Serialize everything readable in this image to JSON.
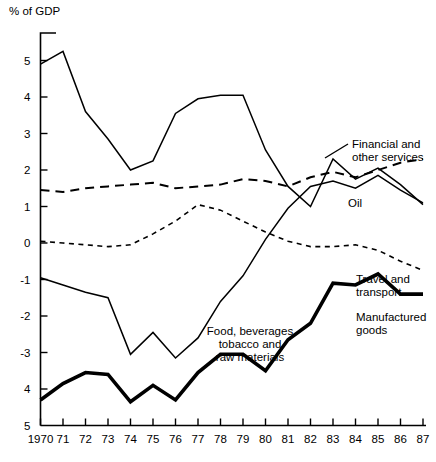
{
  "chart_data": {
    "type": "line",
    "title": "",
    "ylabel": "% of GDP",
    "xlabel": "",
    "ylim": [
      -5,
      5.6
    ],
    "xlim": [
      1970,
      1987
    ],
    "grid": false,
    "legend_position": "inline-annotations",
    "yticks": [
      5,
      4,
      3,
      2,
      1,
      0,
      -1,
      -2,
      -3,
      -4,
      -5
    ],
    "ytick_labels": [
      "5",
      "4",
      "3",
      "2",
      "1",
      "0",
      "-1",
      "-2",
      "-3",
      "4",
      "5"
    ],
    "x": [
      1970,
      1971,
      1972,
      1973,
      1974,
      1975,
      1976,
      1977,
      1978,
      1979,
      1980,
      1981,
      1982,
      1983,
      1984,
      1985,
      1986,
      1987
    ],
    "xtick_labels": [
      "1970",
      "71",
      "72",
      "73",
      "74",
      "75",
      "76",
      "77",
      "78",
      "79",
      "80",
      "81",
      "82",
      "83",
      "84",
      "85",
      "86",
      "87"
    ],
    "series": [
      {
        "name": "Oil",
        "style": "solid-thin",
        "values": [
          4.9,
          5.25,
          3.6,
          2.85,
          2.0,
          2.25,
          3.55,
          3.95,
          4.05,
          4.05,
          2.55,
          1.55,
          1.0,
          2.3,
          1.75,
          2.05,
          1.6,
          1.05
        ]
      },
      {
        "name": "Financial and other services",
        "style": "dashed-long",
        "values": [
          1.45,
          1.4,
          1.5,
          1.55,
          1.6,
          1.65,
          1.5,
          1.55,
          1.6,
          1.75,
          1.7,
          1.55,
          1.8,
          1.95,
          1.8,
          2.0,
          2.2,
          2.3
        ]
      },
      {
        "name": "Travel and transport",
        "style": "dashed-short",
        "values": [
          0.05,
          0.0,
          -0.05,
          -0.1,
          -0.05,
          0.25,
          0.6,
          1.05,
          0.9,
          0.6,
          0.3,
          0.05,
          -0.1,
          -0.1,
          -0.05,
          -0.2,
          -0.5,
          -0.75
        ]
      },
      {
        "name": "Food, beverages tobacco and raw materials",
        "style": "solid-thin",
        "values": [
          -0.95,
          -1.15,
          -1.35,
          -1.5,
          -3.05,
          -2.45,
          -3.15,
          -2.6,
          -1.6,
          -0.9,
          0.1,
          0.95,
          1.55,
          1.7,
          1.5,
          1.85,
          1.45,
          1.1
        ]
      },
      {
        "name": "Manufactured goods",
        "style": "solid-thick",
        "values": [
          -4.3,
          -3.85,
          -3.55,
          -3.6,
          -4.35,
          -3.9,
          -4.3,
          -3.55,
          -3.05,
          -3.05,
          -3.5,
          -2.65,
          -2.2,
          -1.1,
          -1.15,
          -0.85,
          -1.4,
          -1.4
        ]
      }
    ],
    "annotations": [
      {
        "name": "financial-label",
        "text_lines": [
          "Financial and",
          "other services"
        ]
      },
      {
        "name": "oil-label",
        "text_lines": [
          "Oil"
        ]
      },
      {
        "name": "travel-label",
        "text_lines": [
          "Travel and",
          "transport"
        ]
      },
      {
        "name": "manufactured-label",
        "text_lines": [
          "Manufactured",
          "goods"
        ]
      },
      {
        "name": "food-label",
        "text_lines": [
          "Food, beverages",
          "tobacco and",
          "raw materials"
        ]
      }
    ]
  },
  "labels": {
    "y_axis_title": "% of GDP",
    "financial_line1": "Financial and",
    "financial_line2": "other services",
    "oil": "Oil",
    "travel_line1": "Travel and",
    "travel_line2": "transport",
    "manufactured_line1": "Manufactured",
    "manufactured_line2": "goods",
    "food_line1": "Food, beverages",
    "food_line2": "tobacco and",
    "food_line3": "raw materials"
  }
}
